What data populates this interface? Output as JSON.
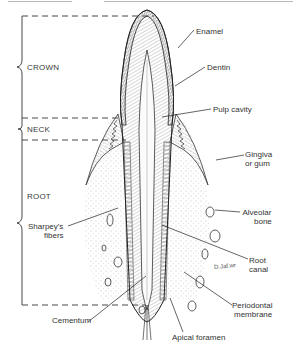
{
  "diagram": {
    "regions": [
      {
        "label": "CROWN"
      },
      {
        "label": "NECK"
      },
      {
        "label": "ROOT"
      }
    ],
    "labels": {
      "enamel": "Enamel",
      "dentin": "Dentin",
      "pulp_cavity": "Pulp cavity",
      "gingiva_line1": "Gingiva",
      "gingiva_line2": "or gum",
      "alveolar_line1": "Alveolar",
      "alveolar_line2": "bone",
      "root_canal_line1": "Root",
      "root_canal_line2": "canal",
      "periodontal_line1": "Periodontal",
      "periodontal_line2": "membrane",
      "apical_foramen": "Apical foramen",
      "cementum": "Cementum",
      "sharpeys_line1": "Sharpey's",
      "sharpeys_line2": "fibers",
      "signature": "D.Jaf.wr"
    },
    "colors": {
      "ink": "#2b2b2b",
      "hatch": "#6e6e6e",
      "paper": "#ffffff"
    }
  }
}
